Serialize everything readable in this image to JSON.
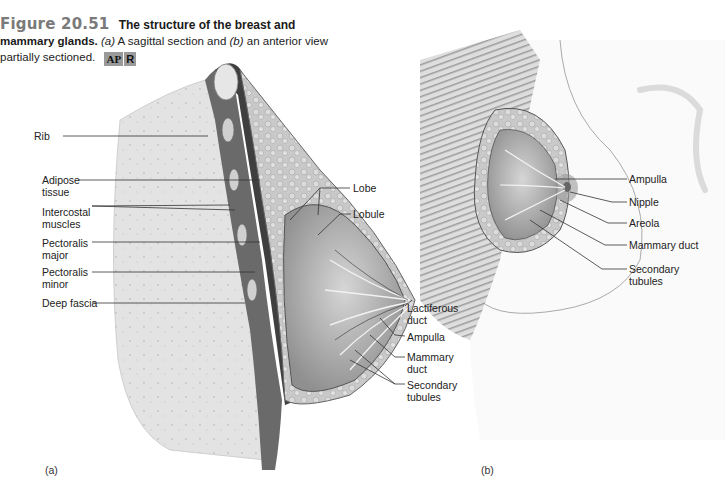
{
  "figure": {
    "number": "Figure 20.51",
    "title": "The structure of the breast and",
    "title_cont": "mammary glands.",
    "description_a_marker": "(a)",
    "description_a": " A sagittal section and ",
    "description_b_marker": "(b)",
    "description_b": " an anterior view",
    "description_end": "partially sectioned.",
    "badges": [
      "AP",
      "R"
    ]
  },
  "panel_a": {
    "label": "(a)",
    "labels_left": [
      {
        "text": "Rib"
      },
      {
        "text": "Adipose\ntissue"
      },
      {
        "text": "Intercostal\nmuscles"
      },
      {
        "text": "Pectoralis\nmajor"
      },
      {
        "text": "Pectoralis\nminor"
      },
      {
        "text": "Deep fascia"
      }
    ],
    "labels_right": [
      {
        "text": "Lobe"
      },
      {
        "text": "Lobule"
      },
      {
        "text": "Lactiferous\nduct"
      },
      {
        "text": "Ampulla"
      },
      {
        "text": "Mammary\nduct"
      },
      {
        "text": "Secondary\ntubules"
      }
    ]
  },
  "panel_b": {
    "label": "(b)",
    "labels": [
      {
        "text": "Ampulla"
      },
      {
        "text": "Nipple"
      },
      {
        "text": "Areola"
      },
      {
        "text": "Mammary duct"
      },
      {
        "text": "Secondary\ntubules"
      }
    ]
  },
  "colors": {
    "figure_number": "#7a7a7a",
    "badge_bg": "#9a9a9a",
    "tissue_light": "#e4e4e4",
    "tissue_mid": "#b8b8b8",
    "tissue_dark": "#555555",
    "leader_line": "#333333"
  }
}
